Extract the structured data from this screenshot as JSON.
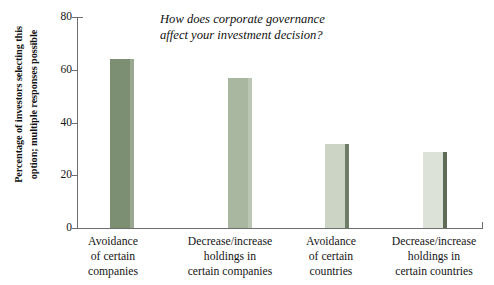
{
  "chart_data": {
    "type": "bar",
    "title": "How does corporate governance\naffect your investment decision?",
    "xlabel": "",
    "ylabel": "Percentage of investors selecting this\noption; multiple responses possible",
    "categories": [
      "Avoidance\nof certain\ncompanies",
      "Decrease/increase\nholdings in\ncertain companies",
      "Avoidance\nof certain\ncountries",
      "Decrease/increase\nholdings in\ncertain countries"
    ],
    "values": [
      64,
      57,
      32,
      29
    ],
    "ylim": [
      0,
      80
    ],
    "yticks": [
      0,
      20,
      40,
      60,
      80
    ],
    "ytick_labels": [
      "0",
      "20",
      "40",
      "60",
      "80"
    ],
    "grid": false,
    "legend": false,
    "bar_colors": [
      "#7d8f72",
      "#a9b6a0",
      "#ccd4c6",
      "#dde2d8"
    ],
    "bar_side_colors": [
      "#9aa892",
      "#bcc6b4",
      "#6d7d66",
      "#5d6b57"
    ]
  },
  "axis": {
    "tick_0": "0",
    "tick_20": "20",
    "tick_40": "40",
    "tick_60": "60",
    "tick_80": "80"
  },
  "labels": {
    "cat_0": "Avoidance\nof certain\ncompanies",
    "cat_1": "Decrease/increase\nholdings in\ncertain companies",
    "cat_2": "Avoidance\nof certain\ncountries",
    "cat_3": "Decrease/increase\nholdings in\ncertain countries"
  }
}
